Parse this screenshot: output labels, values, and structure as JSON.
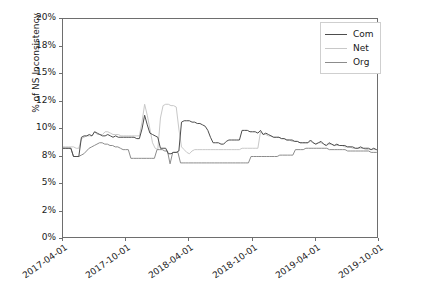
{
  "chart_data": {
    "type": "line",
    "title": "",
    "xlabel": "",
    "ylabel": "% of NS Inconsistency",
    "grid": false,
    "legend_position": "upper right",
    "ytick_labels": [
      "20%",
      "18%",
      "15%",
      "12%",
      "10%",
      "8%",
      "5%",
      "2%",
      "0%"
    ],
    "ytick_values": [
      20,
      18,
      15,
      12,
      10,
      8,
      5,
      2,
      0
    ],
    "ylim": [
      0,
      20
    ],
    "xtick_labels": [
      "2017-04-01",
      "2017-10-01",
      "2018-04-01",
      "2018-10-01",
      "2019-04-01",
      "2019-10-01"
    ],
    "xlim": [
      "2017-04-01",
      "2019-10-01"
    ],
    "series": [
      {
        "name": "Com",
        "color": "#4d4d4d",
        "values": [
          8.6,
          8.6,
          8.6,
          8.6,
          8.0,
          8.0,
          8.0,
          9.4,
          9.5,
          9.5,
          9.6,
          9.5,
          9.8,
          9.7,
          9.6,
          9.5,
          9.5,
          9.6,
          9.5,
          9.4,
          9.5,
          9.4,
          9.4,
          9.4,
          9.4,
          9.4,
          9.4,
          9.4,
          9.3,
          9.3,
          10.0,
          11.0,
          10.3,
          9.7,
          9.6,
          9.5,
          9.4,
          8.6,
          8.6,
          8.6,
          8.2,
          8.2,
          8.3,
          8.3,
          8.4,
          10.5,
          10.6,
          10.6,
          10.6,
          10.5,
          10.5,
          10.4,
          10.4,
          10.3,
          10.2,
          9.9,
          9.4,
          9.0,
          9.0,
          9.0,
          8.9,
          8.9,
          9.1,
          9.2,
          9.2,
          9.2,
          9.2,
          9.2,
          9.9,
          9.9,
          9.9,
          9.8,
          9.8,
          9.8,
          9.7,
          9.9,
          9.6,
          9.7,
          9.6,
          9.5,
          9.4,
          9.4,
          9.4,
          9.3,
          9.3,
          9.2,
          9.2,
          9.2,
          9.1,
          9.1,
          9.0,
          9.0,
          9.0,
          9.0,
          9.2,
          9.0,
          8.9,
          9.0,
          9.1,
          8.9,
          8.8,
          9.0,
          8.9,
          8.8,
          8.9,
          8.8,
          8.8,
          8.8,
          8.7,
          8.7,
          8.7,
          8.6,
          8.6,
          8.7,
          8.6,
          8.6,
          8.6,
          8.5,
          8.6,
          8.5,
          8.5
        ]
      },
      {
        "name": "Net",
        "color": "#c8c8c8",
        "values": [
          8.7,
          8.7,
          8.7,
          8.7,
          8.7,
          8.6,
          8.6,
          9.3,
          9.4,
          9.5,
          9.5,
          9.5,
          9.8,
          9.6,
          9.6,
          9.6,
          9.8,
          9.8,
          9.7,
          9.6,
          9.6,
          9.6,
          9.5,
          9.5,
          9.5,
          9.5,
          9.5,
          9.5,
          9.5,
          9.5,
          10.5,
          11.8,
          11.0,
          10.0,
          9.0,
          8.6,
          8.5,
          10.8,
          11.7,
          11.8,
          11.8,
          11.7,
          11.7,
          11.6,
          10.0,
          8.7,
          8.5,
          8.3,
          8.2,
          8.4,
          8.5,
          8.5,
          8.5,
          8.5,
          8.5,
          8.5,
          8.5,
          8.5,
          8.5,
          8.5,
          8.5,
          8.5,
          8.5,
          8.5,
          8.5,
          8.5,
          8.5,
          8.5,
          8.6,
          8.6,
          8.6,
          8.6,
          8.6,
          8.6,
          8.6,
          9.8,
          9.6,
          9.6,
          9.5,
          9.5,
          9.4,
          9.4,
          9.4,
          9.3,
          9.3,
          9.2,
          9.2,
          9.1,
          9.1,
          9.1,
          9.0,
          9.0,
          9.0,
          9.0,
          9.1,
          9.0,
          8.9,
          9.0,
          9.0,
          8.9,
          8.8,
          8.9,
          8.9,
          8.8,
          8.8,
          8.8,
          8.8,
          8.7,
          8.7,
          8.7,
          8.6,
          8.6,
          8.6,
          8.6,
          8.6,
          8.5,
          8.5,
          8.5,
          8.5,
          8.5,
          8.5
        ]
      },
      {
        "name": "Org",
        "color": "#8c8c8c",
        "values": [
          8.6,
          8.6,
          8.6,
          8.6,
          8.0,
          8.0,
          8.0,
          8.1,
          8.2,
          8.4,
          8.6,
          8.7,
          8.8,
          8.9,
          9.0,
          9.0,
          8.9,
          8.9,
          8.8,
          8.8,
          8.7,
          8.7,
          8.6,
          8.5,
          8.5,
          8.5,
          7.8,
          7.8,
          7.8,
          7.8,
          7.8,
          7.8,
          7.8,
          7.8,
          7.8,
          7.8,
          8.5,
          8.5,
          8.5,
          8.4,
          8.4,
          7.2,
          8.3,
          8.3,
          8.3,
          7.3,
          7.3,
          7.3,
          7.3,
          7.3,
          7.3,
          7.3,
          7.3,
          7.3,
          7.3,
          7.3,
          7.3,
          7.3,
          7.3,
          7.3,
          7.3,
          7.3,
          7.3,
          7.3,
          7.3,
          7.3,
          7.3,
          7.3,
          7.3,
          7.3,
          7.3,
          7.3,
          8.0,
          8.0,
          8.0,
          8.0,
          8.0,
          8.0,
          8.0,
          8.0,
          8.0,
          8.0,
          8.0,
          8.1,
          8.1,
          8.1,
          8.1,
          8.1,
          8.1,
          8.5,
          8.5,
          8.5,
          8.5,
          8.6,
          8.6,
          8.6,
          8.6,
          8.6,
          8.6,
          8.6,
          8.6,
          8.6,
          8.5,
          8.5,
          8.5,
          8.5,
          8.5,
          8.5,
          8.5,
          8.4,
          8.4,
          8.4,
          8.4,
          8.4,
          8.4,
          8.4,
          8.4,
          8.4,
          8.3,
          8.3,
          8.3,
          8.3
        ]
      }
    ]
  },
  "legend": {
    "items": [
      {
        "label": "Com",
        "color": "#4d4d4d"
      },
      {
        "label": "Net",
        "color": "#c8c8c8"
      },
      {
        "label": "Org",
        "color": "#8c8c8c"
      }
    ]
  },
  "axes": {
    "y_title": "% of NS Inconsistency"
  }
}
